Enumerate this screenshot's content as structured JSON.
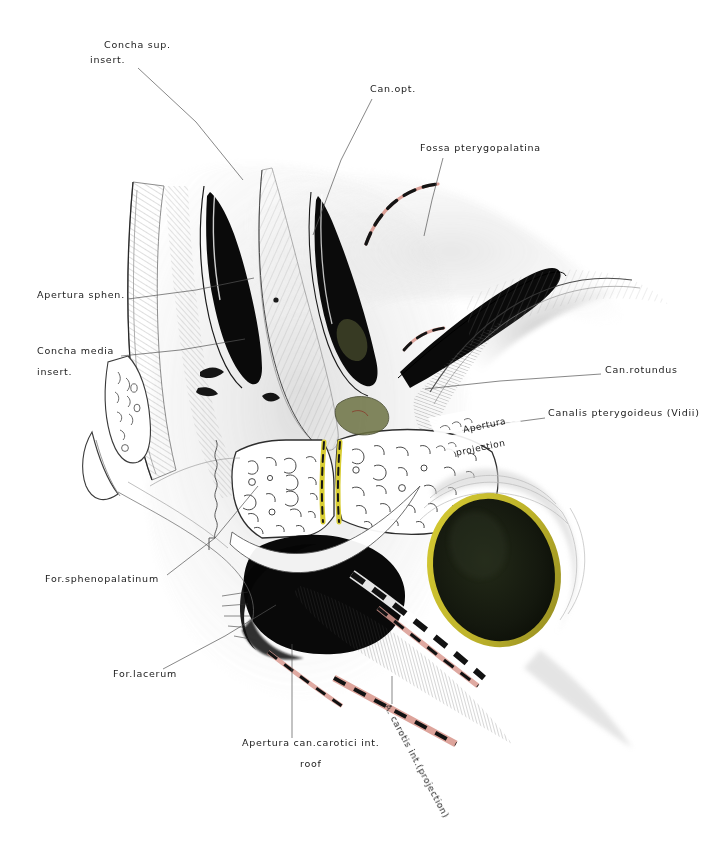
{
  "plate": {
    "title": "Sagittal section of the sphenoid and pterygopalatine region",
    "medium": "pencil and coloured-pencil anatomical drawing",
    "background_color": "#ffffff",
    "ink_color": "#1a1a1a",
    "accent_colors": {
      "bone_shadow": "#6f6f6f",
      "deep_shadow": "#0b0b0b",
      "salmon_dashed": "#d99a90",
      "yellow_rim": "#c9bf2a",
      "olive_fill": "#1d2214",
      "cartilage_green": "#8a8f55"
    }
  },
  "labels": [
    {
      "id": "concha-sup-insert",
      "line1": "Concha sup.",
      "line2": "insert.",
      "x": 104,
      "y": 44,
      "leader": [
        [
          138,
          68
        ],
        [
          196,
          122
        ],
        [
          243,
          180
        ]
      ]
    },
    {
      "id": "can-opt",
      "line1": "Can.opt.",
      "line2": "",
      "x": 370,
      "y": 88,
      "leader": [
        [
          372,
          99
        ],
        [
          341,
          160
        ],
        [
          313,
          235
        ]
      ]
    },
    {
      "id": "fossa-pterygopalatina",
      "line1": "Fossa pterygopalatina",
      "line2": "",
      "x": 420,
      "y": 147,
      "leader": [
        [
          443,
          158
        ],
        [
          432,
          200
        ],
        [
          424,
          236
        ]
      ]
    },
    {
      "id": "apertura-sphen",
      "line1": "Apertura sphen.",
      "line2": "",
      "x": 37,
      "y": 294,
      "leader": [
        [
          128,
          299
        ],
        [
          196,
          290
        ],
        [
          254,
          278
        ]
      ]
    },
    {
      "id": "concha-media-insert",
      "line1": "Concha media",
      "line2": "insert.",
      "x": 37,
      "y": 350,
      "leader": [
        [
          121,
          356
        ],
        [
          180,
          350
        ],
        [
          245,
          339
        ]
      ]
    },
    {
      "id": "can-rotundus",
      "line1": "Can.rotundus",
      "line2": "",
      "x": 605,
      "y": 369,
      "leader": [
        [
          601,
          374
        ],
        [
          500,
          381
        ],
        [
          425,
          389
        ]
      ]
    },
    {
      "id": "canalis-pterygoideus-vidii",
      "line1": "Canalis pterygoideus (Vidii)",
      "line2": "",
      "x": 548,
      "y": 412,
      "leader": [
        [
          545,
          418
        ],
        [
          500,
          424
        ],
        [
          462,
          430
        ]
      ]
    },
    {
      "id": "apertura-projection",
      "line1": "Apertura",
      "line2": "projection",
      "x": 462,
      "y": 420,
      "leader": []
    },
    {
      "id": "for-sphenopalatinum",
      "line1": "For.sphenopalatinum",
      "line2": "",
      "x": 45,
      "y": 578,
      "leader": [
        [
          167,
          575
        ],
        [
          215,
          538
        ],
        [
          258,
          486
        ]
      ]
    },
    {
      "id": "for-lacerum",
      "line1": "For.lacerum",
      "line2": "",
      "x": 113,
      "y": 673,
      "leader": [
        [
          163,
          669
        ],
        [
          225,
          636
        ],
        [
          276,
          605
        ]
      ]
    },
    {
      "id": "apertura-can-carotici-roof",
      "line1": "Apertura can.carotici int.",
      "line2": "roof",
      "x": 242,
      "y": 742,
      "leader": [
        [
          292,
          738
        ],
        [
          292,
          690
        ],
        [
          292,
          644
        ]
      ]
    },
    {
      "id": "a-carotis-int-projection",
      "line1": "A. carotis int.(projection)",
      "line2": "",
      "x": 392,
      "y": 706,
      "leader": [
        [
          392,
          704
        ],
        [
          392,
          690
        ],
        [
          392,
          676
        ]
      ]
    }
  ],
  "leader_lines": {
    "color": "#555555",
    "width": 0.7
  },
  "structures": [
    {
      "name": "sphenoid-body",
      "kind": "bone-mass"
    },
    {
      "name": "sphenoid-sinus-cavity",
      "kind": "cavity"
    },
    {
      "name": "sphenoidal-concha",
      "kind": "trabecular-bone"
    },
    {
      "name": "pterygoid-process",
      "kind": "bone-mass"
    },
    {
      "name": "foramen-lacerum-shadow",
      "kind": "deep-shadow"
    },
    {
      "name": "carotid-canal-projection",
      "kind": "dashed-band"
    },
    {
      "name": "pterygopalatine-fossa-outline",
      "kind": "dashed-arc"
    },
    {
      "name": "olive-oval-cavity",
      "kind": "cavity"
    },
    {
      "name": "vomer-rostrum",
      "kind": "yellow-ridge"
    }
  ]
}
